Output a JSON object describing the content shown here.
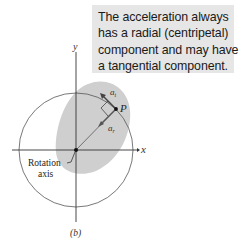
{
  "callout": {
    "lines": [
      "The acceleration always",
      "has a radial (centripetal)",
      "component and may have",
      "a tangential component."
    ]
  },
  "axes": {
    "x_label": "x",
    "y_label": "y"
  },
  "labels": {
    "point": "P",
    "tangential": "a",
    "tangential_sub": "t",
    "radial": "a",
    "radial_sub": "r",
    "rotation_axis_line1": "Rotation",
    "rotation_axis_line2": "axis",
    "figure_caption": "(b)"
  },
  "colors": {
    "callout_bg": "#e6e6e6",
    "body_fill": "#cfcfcf",
    "line": "#333333",
    "text": "#1a1a1a"
  }
}
